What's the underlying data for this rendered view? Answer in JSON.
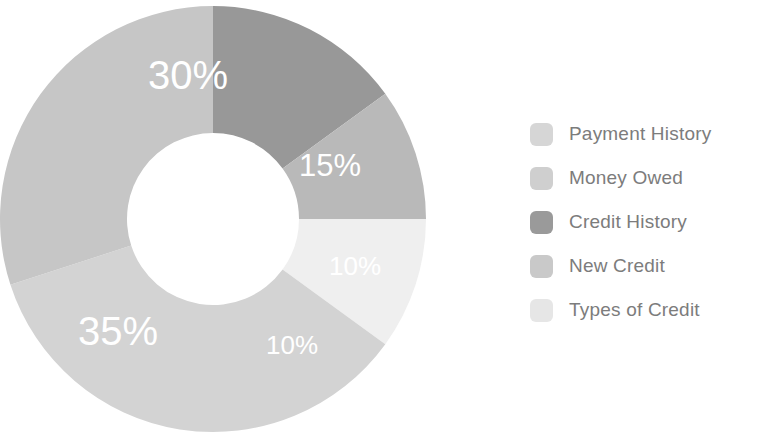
{
  "chart_data": {
    "type": "pie",
    "variant": "donut",
    "title": "",
    "subtitle": "",
    "xlabel": "",
    "ylabel": "",
    "grid": false,
    "legend_position": "right",
    "unit": "%",
    "start_angle_deg": 0,
    "direction": "clockwise",
    "center": {
      "x": 213,
      "y": 219
    },
    "outer_radius": 213,
    "inner_radius": 86,
    "categories": [
      "Payment History",
      "Money Owed",
      "Credit History",
      "New Credit",
      "Types of Credit"
    ],
    "values": [
      30,
      35,
      15,
      10,
      10
    ],
    "colors": [
      "#c6c6c6",
      "#d3d3d3",
      "#989898",
      "#b9b9b9",
      "#efefef"
    ],
    "slices": [
      {
        "name": "Credit History",
        "value": 15,
        "label": "15%",
        "color": "#989898",
        "start_deg": 0,
        "end_deg": 54,
        "label_size": "mid",
        "label_x": 330,
        "label_y": 168
      },
      {
        "name": "New Credit",
        "value": 10,
        "label": "10%",
        "color": "#b9b9b9",
        "start_deg": 54,
        "end_deg": 90,
        "label_size": "small",
        "label_x": 355,
        "label_y": 268
      },
      {
        "name": "Types of Credit",
        "value": 10,
        "label": "10%",
        "color": "#efefef",
        "start_deg": 90,
        "end_deg": 126,
        "label_size": "small",
        "label_x": 292,
        "label_y": 347
      },
      {
        "name": "Money Owed",
        "value": 35,
        "label": "35%",
        "color": "#d3d3d3",
        "start_deg": 126,
        "end_deg": 252,
        "label_size": "big",
        "label_x": 118,
        "label_y": 334
      },
      {
        "name": "Payment History",
        "value": 30,
        "label": "30%",
        "color": "#c6c6c6",
        "start_deg": 252,
        "end_deg": 360,
        "label_size": "big",
        "label_x": 188,
        "label_y": 78
      }
    ]
  },
  "legend": {
    "items": [
      {
        "label": "Payment History",
        "color": "#d6d6d6"
      },
      {
        "label": "Money Owed",
        "color": "#cfcfcf"
      },
      {
        "label": "Credit History",
        "color": "#9a9a9a"
      },
      {
        "label": "New Credit",
        "color": "#c9c9c9"
      },
      {
        "label": "Types of Credit",
        "color": "#e6e6e6"
      }
    ]
  }
}
